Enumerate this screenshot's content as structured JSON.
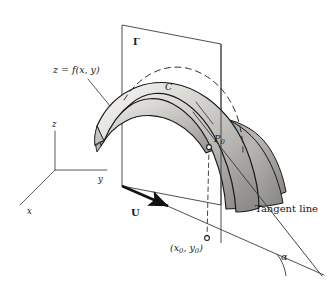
{
  "figure": {
    "type": "math-diagram",
    "background_color": "#ffffff",
    "ink_color": "#1a1a1a"
  },
  "labels": {
    "surface": "z = f(x, y)",
    "plane": "Γ",
    "curve": "C",
    "point": "P",
    "point_subscript": "0",
    "foot_point": "(x",
    "foot_point_sub1": "0",
    "foot_point_mid": ", y",
    "foot_point_sub2": "0",
    "foot_point_end": ")",
    "direction_vector": "U",
    "tangent_line": "Tangent line",
    "angle": "α"
  },
  "axes": {
    "z_label": "z",
    "y_label": "y",
    "x_label": "x"
  },
  "colors": {
    "surface_light": "#f2f1ef",
    "surface_mid": "#b9b7b4",
    "surface_dark": "#8e8c89",
    "surface_right_light": "#cfcdca",
    "surface_right_dark": "#8a8885",
    "outline": "#1a1a1a",
    "thin_line": "#4a4a4a",
    "dashed": "#3a3a3a"
  },
  "geometry": {
    "plane_corners": [
      [
        122,
        25
      ],
      [
        221,
        44
      ],
      [
        221,
        205
      ],
      [
        122,
        186
      ]
    ],
    "axes_origin": [
      55,
      170
    ],
    "axes_z_top": [
      55,
      131
    ],
    "axes_y_end": [
      107,
      170
    ],
    "axes_x_end": [
      20,
      205
    ],
    "base_line_start": [
      122,
      186
    ],
    "base_line_end": [
      318,
      272
    ],
    "foot_marker": [
      208,
      239
    ],
    "p0_marker": [
      215,
      144
    ],
    "tangent_start": [
      194,
      114
    ],
    "tangent_end": [
      318,
      272
    ],
    "arrow_tip": [
      172,
      208
    ],
    "angle_vertex": [
      318,
      272
    ],
    "angle_arc_radius": 42
  }
}
